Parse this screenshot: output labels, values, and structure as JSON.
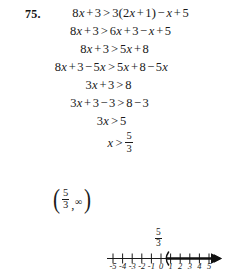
{
  "problem": {
    "number": "75."
  },
  "steps": [
    {
      "id": "step-1",
      "text": "8x + 3 > 3(2x + 1) - x + 5",
      "lhs": [
        "8",
        "x",
        "+",
        "3"
      ],
      "relation": ">",
      "rhs": [
        "3",
        "(",
        "2",
        "x",
        "+",
        "1",
        ")",
        "-",
        "x",
        "+",
        "5"
      ]
    },
    {
      "id": "step-2",
      "text": "8x + 3 > 6x + 3 - x + 5",
      "lhs": [
        "8",
        "x",
        "+",
        "3"
      ],
      "relation": ">",
      "rhs": [
        "6",
        "x",
        "+",
        "3",
        "-",
        "x",
        "+",
        "5"
      ]
    },
    {
      "id": "step-3",
      "text": "8x + 3 > 5x + 8",
      "lhs": [
        "8",
        "x",
        "+",
        "3"
      ],
      "relation": ">",
      "rhs": [
        "5",
        "x",
        "+",
        "8"
      ]
    },
    {
      "id": "step-4",
      "text": "8x + 3 - 5x > 5x + 8 - 5x",
      "lhs": [
        "8",
        "x",
        "+",
        "3",
        "-",
        "5",
        "x"
      ],
      "relation": ">",
      "rhs": [
        "5",
        "x",
        "+",
        "8",
        "-",
        "5",
        "x"
      ]
    },
    {
      "id": "step-5",
      "text": "3x + 3 > 8",
      "lhs": [
        "3",
        "x",
        "+",
        "3"
      ],
      "relation": ">",
      "rhs": [
        "8"
      ]
    },
    {
      "id": "step-6",
      "text": "3x + 3 - 3 > 8 - 3",
      "lhs": [
        "3",
        "x",
        "+",
        "3",
        "-",
        "3"
      ],
      "relation": ">",
      "rhs": [
        "8",
        "-",
        "3"
      ]
    },
    {
      "id": "step-7",
      "text": "3x > 5",
      "lhs": [
        "3",
        "x"
      ],
      "relation": ">",
      "rhs": [
        "5"
      ]
    },
    {
      "id": "step-8",
      "text": "x > 5/3",
      "lhs": [
        "x"
      ],
      "relation": ">",
      "fraction": {
        "numerator": "5",
        "denominator": "3"
      }
    }
  ],
  "step_glyphs": {
    "s1_8": "8",
    "s1_x1": "x",
    "s1_plus1": "+",
    "s1_3a": "3",
    "s1_rel": ">",
    "s1_3b": "3",
    "s1_lp": "(",
    "s1_2": "2",
    "s1_x2": "x",
    "s1_plus2": "+",
    "s1_1": "1",
    "s1_rp": ")",
    "s1_minus": "−",
    "s1_x3": "x",
    "s1_plus3": "+",
    "s1_5": "5",
    "s2_8": "8",
    "s2_x1": "x",
    "s2_plus1": "+",
    "s2_3a": "3",
    "s2_rel": ">",
    "s2_6": "6",
    "s2_x2": "x",
    "s2_plus2": "+",
    "s2_3b": "3",
    "s2_minus": "−",
    "s2_x3": "x",
    "s2_plus3": "+",
    "s2_5": "5",
    "s3_8": "8",
    "s3_x1": "x",
    "s3_plus1": "+",
    "s3_3": "3",
    "s3_rel": ">",
    "s3_5": "5",
    "s3_x2": "x",
    "s3_plus2": "+",
    "s3_8b": "8",
    "s4_8": "8",
    "s4_x1": "x",
    "s4_plus1": "+",
    "s4_3": "3",
    "s4_minus1": "−",
    "s4_5a": "5",
    "s4_x2": "x",
    "s4_rel": ">",
    "s4_5b": "5",
    "s4_x3": "x",
    "s4_plus2": "+",
    "s4_8b": "8",
    "s4_minus2": "−",
    "s4_5c": "5",
    "s4_x4": "x",
    "s5_3": "3",
    "s5_x": "x",
    "s5_plus": "+",
    "s5_3b": "3",
    "s5_rel": ">",
    "s5_8": "8",
    "s6_3": "3",
    "s6_x": "x",
    "s6_plus": "+",
    "s6_3b": "3",
    "s6_minus1": "−",
    "s6_3c": "3",
    "s6_rel": ">",
    "s6_8": "8",
    "s6_minus2": "−",
    "s6_3d": "3",
    "s7_3": "3",
    "s7_x": "x",
    "s7_rel": ">",
    "s7_5": "5",
    "s8_x": "x",
    "s8_rel": ">",
    "s8_num": "5",
    "s8_den": "3"
  },
  "interval": {
    "open_paren": "(",
    "numerator": "5",
    "denominator": "3",
    "comma": ",",
    "infinity": "∞",
    "close_paren": ")",
    "text": "(5/3, ∞)"
  },
  "numberline": {
    "critical_label": {
      "numerator": "5",
      "denominator": "3"
    },
    "critical_value": 1.6667,
    "open_endpoint": true,
    "shaded_direction": "right",
    "arrow_right": true,
    "arrow_left": false,
    "tick_values": [
      -5,
      -4,
      -3,
      -2,
      -1,
      0,
      1,
      2,
      3,
      4,
      5
    ],
    "tick_labels": [
      "-5",
      "-4",
      "-3",
      "-2",
      "-1",
      "0",
      "1",
      "2",
      "3",
      "4",
      "5"
    ],
    "axis_start_x": 107,
    "axis_end_x": 220
  },
  "colors": {
    "ink": "#1a1a1a",
    "page": "#ffffff"
  }
}
